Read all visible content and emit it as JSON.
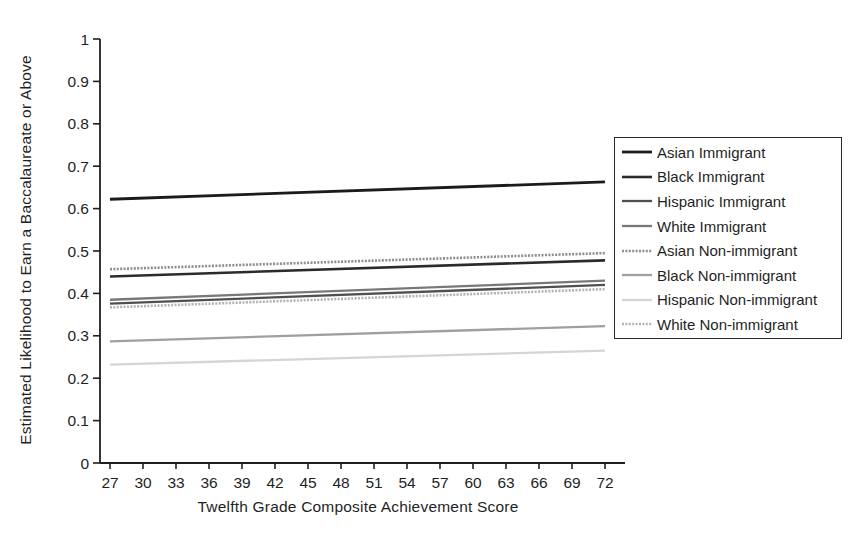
{
  "chart_data": {
    "type": "line",
    "title": "",
    "xlabel": "Twelfth Grade Composite Achievement Score",
    "ylabel": "Estimated Likelihood to Earn a Baccalaureate or Above",
    "xlim": [
      27,
      72
    ],
    "ylim": [
      0,
      1
    ],
    "grid": false,
    "x_tick_labels": [
      "27",
      "30",
      "33",
      "36",
      "39",
      "42",
      "45",
      "48",
      "51",
      "54",
      "57",
      "60",
      "63",
      "66",
      "69",
      "72"
    ],
    "y_ticks": [
      {
        "value": 0,
        "label": "0"
      },
      {
        "value": 0.1,
        "label": "0.1"
      },
      {
        "value": 0.2,
        "label": "0.2"
      },
      {
        "value": 0.3,
        "label": "0.3"
      },
      {
        "value": 0.4,
        "label": "0.4"
      },
      {
        "value": 0.5,
        "label": "0.5"
      },
      {
        "value": 0.6,
        "label": "0.6"
      },
      {
        "value": 0.7,
        "label": "0.7"
      },
      {
        "value": 0.8,
        "label": "0.8"
      },
      {
        "value": 0.9,
        "label": "0.9"
      },
      {
        "value": 1,
        "label": "1"
      }
    ],
    "legend": {
      "position": "right",
      "border": true
    },
    "series": [
      {
        "name": "Asian Immigrant",
        "x": [
          27,
          72
        ],
        "values": [
          0.622,
          0.663
        ],
        "color": "#1b1b1b",
        "width": 2.8,
        "line_style": "solid"
      },
      {
        "name": "Black Immigrant",
        "x": [
          27,
          72
        ],
        "values": [
          0.44,
          0.478
        ],
        "color": "#2b2b2b",
        "width": 2.6,
        "line_style": "solid"
      },
      {
        "name": "Hispanic Immigrant",
        "x": [
          27,
          72
        ],
        "values": [
          0.376,
          0.42
        ],
        "color": "#4f4f4f",
        "width": 2.3,
        "line_style": "solid"
      },
      {
        "name": "White Immigrant",
        "x": [
          27,
          72
        ],
        "values": [
          0.385,
          0.43
        ],
        "color": "#787878",
        "width": 2.3,
        "line_style": "solid"
      },
      {
        "name": "Asian Non-immigrant",
        "x": [
          27,
          72
        ],
        "values": [
          0.457,
          0.495
        ],
        "color": "#8d8d8d",
        "width": 2.6,
        "line_style": "dotted"
      },
      {
        "name": "Black Non-immigrant",
        "x": [
          27,
          72
        ],
        "values": [
          0.287,
          0.323
        ],
        "color": "#9f9f9f",
        "width": 2.3,
        "line_style": "solid"
      },
      {
        "name": "Hispanic Non-immigrant",
        "x": [
          27,
          72
        ],
        "values": [
          0.232,
          0.265
        ],
        "color": "#d5d5d5",
        "width": 2.3,
        "line_style": "solid"
      },
      {
        "name": "White Non-immigrant",
        "x": [
          27,
          72
        ],
        "values": [
          0.367,
          0.41
        ],
        "color": "#b2b2b2",
        "width": 2.6,
        "line_style": "dotted"
      }
    ]
  }
}
